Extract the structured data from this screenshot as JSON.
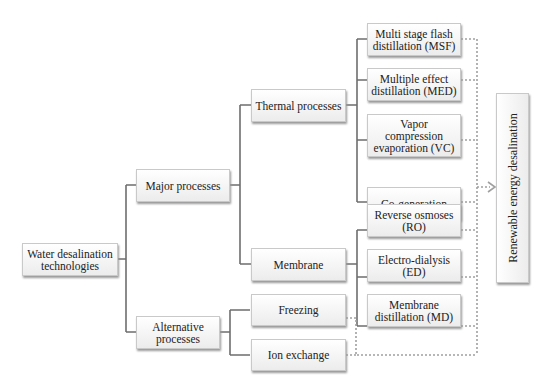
{
  "diagram": {
    "root": "Water desalination\ntechnologies",
    "level1": {
      "major": "Major processes",
      "alternative": "Alternative\nprocesses"
    },
    "level2": {
      "thermal": "Thermal processes",
      "membrane": "Membrane",
      "freezing": "Freezing",
      "ion_exchange": "Ion exchange"
    },
    "thermal_children": [
      "Multi stage flash\ndistillation (MSF)",
      "Multiple effect\ndistillation (MED)",
      "Vapor\ncompression\nevaporation (VC)",
      "Co-generation"
    ],
    "membrane_children": [
      "Reverse osmoses\n(RO)",
      "Electro-dialysis (ED)",
      "Membrane\ndistillation (MD)"
    ],
    "target": "Renewable energy desalination",
    "colors": {
      "line": "#6e6e6e",
      "dotted": "#a0a0a0"
    }
  }
}
